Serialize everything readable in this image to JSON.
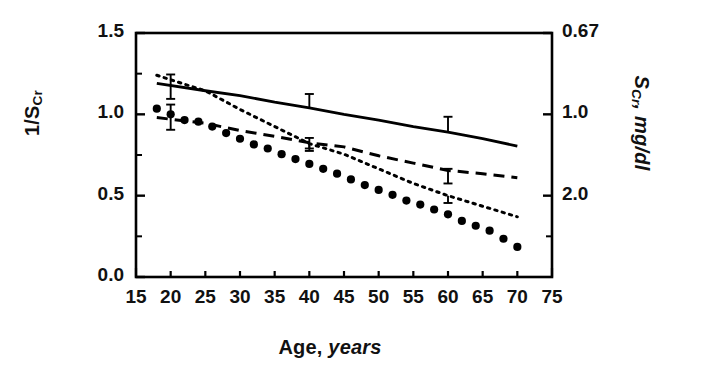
{
  "chart_data": {
    "type": "line",
    "title": "",
    "xlabel_main": "Age,",
    "xlabel_italic": "years",
    "ylabel_left_main": "1/S",
    "ylabel_left_sub": "Cr",
    "ylabel_right_main": "S",
    "ylabel_right_sub": "Cr",
    "ylabel_right_units": ", mg/dl",
    "xlim": [
      15,
      75
    ],
    "ylim": [
      0.0,
      1.5
    ],
    "grid": false,
    "legend": "none",
    "xticks": [
      15,
      20,
      25,
      30,
      35,
      40,
      45,
      50,
      55,
      60,
      65,
      70,
      75
    ],
    "xtick_labels": [
      "15",
      "20",
      "25",
      "30",
      "35",
      "40",
      "45",
      "50",
      "55",
      "60",
      "65",
      "70",
      "75"
    ],
    "yticks_left": [
      0.0,
      0.5,
      1.0,
      1.5
    ],
    "ytick_labels_left": [
      "0.0",
      "0.5",
      "1.0",
      "1.5"
    ],
    "yminor_left": [
      0.25,
      0.75,
      1.25
    ],
    "yticks_right_values": [
      1.5,
      1.0,
      0.5
    ],
    "ytick_labels_right": [
      "0.67",
      "1.0",
      "2.0"
    ],
    "yminor_right": [
      0.25
    ],
    "series": [
      {
        "name": "solid-line",
        "style": "solid",
        "marker": "none",
        "x": [
          18,
          25,
          30,
          35,
          40,
          45,
          50,
          55,
          60,
          65,
          70
        ],
        "values": [
          1.19,
          1.145,
          1.115,
          1.075,
          1.04,
          1.0,
          0.965,
          0.925,
          0.89,
          0.85,
          0.805
        ]
      },
      {
        "name": "dotted-line",
        "style": "dotted",
        "marker": "none",
        "x": [
          18,
          22,
          25,
          30,
          35,
          40,
          45,
          50,
          55,
          60,
          65,
          70
        ],
        "values": [
          1.24,
          1.185,
          1.145,
          1.03,
          0.925,
          0.82,
          0.755,
          0.665,
          0.575,
          0.5,
          0.435,
          0.37
        ]
      },
      {
        "name": "dashed-line",
        "style": "dashed",
        "marker": "none",
        "x": [
          18,
          25,
          30,
          35,
          40,
          45,
          50,
          55,
          60,
          65,
          70
        ],
        "values": [
          0.98,
          0.945,
          0.9,
          0.865,
          0.825,
          0.8,
          0.745,
          0.7,
          0.655,
          0.635,
          0.61
        ]
      },
      {
        "name": "filled-circle-markers",
        "style": "markers",
        "marker": "filled-circle",
        "x": [
          18,
          20,
          22,
          24,
          26,
          28,
          30,
          32,
          34,
          36,
          38,
          40,
          42,
          44,
          46,
          48,
          50,
          52,
          54,
          56,
          58,
          60,
          62,
          64,
          66,
          68,
          70
        ],
        "values": [
          1.035,
          1.0,
          0.965,
          0.955,
          0.925,
          0.885,
          0.85,
          0.815,
          0.79,
          0.755,
          0.725,
          0.695,
          0.665,
          0.635,
          0.6,
          0.565,
          0.535,
          0.505,
          0.47,
          0.445,
          0.415,
          0.385,
          0.345,
          0.315,
          0.285,
          0.235,
          0.185
        ]
      }
    ],
    "error_bars": [
      {
        "series": "solid-line",
        "x": 20,
        "y": 1.165,
        "lower": 1.095,
        "upper": 1.245
      },
      {
        "series": "solid-line",
        "x": 40,
        "y": 1.04,
        "lower": 1.04,
        "upper": 1.125
      },
      {
        "series": "solid-line",
        "x": 60,
        "y": 0.89,
        "lower": 0.89,
        "upper": 0.985
      },
      {
        "series": "dashed-line",
        "x": 20,
        "y": 0.995,
        "lower": 0.905,
        "upper": 1.06
      },
      {
        "series": "dashed-line",
        "x": 40,
        "y": 0.825,
        "lower": 0.775,
        "upper": 0.825
      },
      {
        "series": "dashed-line",
        "x": 60,
        "y": 0.655,
        "lower": 0.575,
        "upper": 0.665
      },
      {
        "series": "dotted-line",
        "x": 40,
        "y": 0.82,
        "lower": 0.79,
        "upper": 0.855
      },
      {
        "series": "dotted-line",
        "x": 60,
        "y": 0.5,
        "lower": 0.455,
        "upper": 0.5
      }
    ],
    "colors": {
      "line": "#000000",
      "marker": "#000000",
      "frame": "#000000",
      "background": "#ffffff"
    }
  }
}
